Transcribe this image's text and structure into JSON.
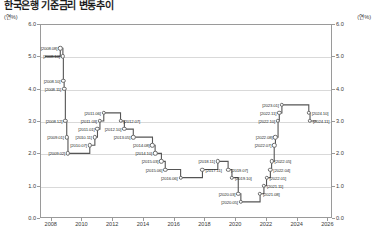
{
  "title": "한국은행 기준금리 변동추이",
  "axis": {
    "unit_left": "(연%)",
    "unit_right": "(연%)",
    "yticks": [
      "6.0",
      "5.0",
      "4.0",
      "3.0",
      "2.0",
      "1.0",
      "0.0"
    ],
    "xticks": [
      "2008",
      "2010",
      "2012",
      "2014",
      "2016",
      "2018",
      "2020",
      "2022",
      "2024",
      "2026"
    ]
  },
  "chart_data": {
    "type": "line",
    "title": "한국은행 기준금리 변동추이",
    "xlabel": "",
    "ylabel": "(연%)",
    "ylim": [
      0.0,
      6.0
    ],
    "xlim": [
      2007.3,
      2026.3
    ],
    "grid": true,
    "legend": "none",
    "step": "post",
    "series": [
      {
        "name": "한국은행 기준금리",
        "points": [
          {
            "date": "2007.08",
            "x": 2007.62,
            "y": 5.0,
            "label": "",
            "show": false
          },
          {
            "date": "2008.08",
            "x": 2008.62,
            "y": 5.25,
            "label": "[2008.08]",
            "side": "left"
          },
          {
            "date": "2008.10",
            "x": 2008.79,
            "y": 5.0,
            "label": "[2008.10]",
            "side": "left"
          },
          {
            "date": "2008.10",
            "x": 2008.82,
            "y": 4.25,
            "label": "[2008.10]",
            "side": "left"
          },
          {
            "date": "2008.11",
            "x": 2008.87,
            "y": 4.0,
            "label": "[2008.11]",
            "side": "left"
          },
          {
            "date": "2008.12",
            "x": 2008.95,
            "y": 3.0,
            "label": "[2008.12]",
            "side": "left"
          },
          {
            "date": "2009.01",
            "x": 2009.04,
            "y": 2.5,
            "label": "[2009.01]",
            "side": "left"
          },
          {
            "date": "2009.02",
            "x": 2009.12,
            "y": 2.0,
            "label": "[2009.02]",
            "side": "left"
          },
          {
            "date": "2010.07",
            "x": 2010.54,
            "y": 2.25,
            "label": "[2010.07]",
            "side": "left"
          },
          {
            "date": "2010.11",
            "x": 2010.87,
            "y": 2.5,
            "label": "[2010.11]",
            "side": "left"
          },
          {
            "date": "2011.01",
            "x": 2011.04,
            "y": 2.75,
            "label": "[2011.01]",
            "side": "left"
          },
          {
            "date": "2011.03",
            "x": 2011.2,
            "y": 3.0,
            "label": "[2011.03]",
            "side": "left"
          },
          {
            "date": "2011.06",
            "x": 2011.45,
            "y": 3.25,
            "label": "[2011.06]",
            "side": "left"
          },
          {
            "date": "2012.07",
            "x": 2012.54,
            "y": 3.0,
            "label": "[2012.07]",
            "side": "right"
          },
          {
            "date": "2012.10",
            "x": 2012.79,
            "y": 2.75,
            "label": "[2012.10]",
            "side": "left"
          },
          {
            "date": "2013.05",
            "x": 2013.37,
            "y": 2.5,
            "label": "[2013.05]",
            "side": "left"
          },
          {
            "date": "2014.08",
            "x": 2014.62,
            "y": 2.25,
            "label": "[2014.08]",
            "side": "left"
          },
          {
            "date": "2014.10",
            "x": 2014.79,
            "y": 2.0,
            "label": "[2014.10]",
            "side": "left"
          },
          {
            "date": "2015.03",
            "x": 2015.2,
            "y": 1.75,
            "label": "[2015.03]",
            "side": "left"
          },
          {
            "date": "2015.06",
            "x": 2015.45,
            "y": 1.5,
            "label": "[2015.06]",
            "side": "left"
          },
          {
            "date": "2016.06",
            "x": 2016.45,
            "y": 1.25,
            "label": "[2016.06]",
            "side": "left"
          },
          {
            "date": "2017.11",
            "x": 2017.87,
            "y": 1.5,
            "label": "[2017.11]",
            "side": "right"
          },
          {
            "date": "2018.11",
            "x": 2018.87,
            "y": 1.75,
            "label": "[2018.11]",
            "side": "left"
          },
          {
            "date": "2019.07",
            "x": 2019.54,
            "y": 1.5,
            "label": "[2019.07]",
            "side": "right"
          },
          {
            "date": "2019.10",
            "x": 2019.79,
            "y": 1.25,
            "label": "[2019.10]",
            "side": "right"
          },
          {
            "date": "2020.03",
            "x": 2020.2,
            "y": 0.75,
            "label": "[2020.03]",
            "side": "left"
          },
          {
            "date": "2020.05",
            "x": 2020.37,
            "y": 0.5,
            "label": "[2020.05]",
            "side": "left"
          },
          {
            "date": "2021.08",
            "x": 2021.62,
            "y": 0.75,
            "label": "[2021.08]",
            "side": "right"
          },
          {
            "date": "2021.11",
            "x": 2021.87,
            "y": 1.0,
            "label": "[2021.11]",
            "side": "right"
          },
          {
            "date": "2022.01",
            "x": 2022.04,
            "y": 1.25,
            "label": "[2022.01]",
            "side": "right"
          },
          {
            "date": "2022.04",
            "x": 2022.29,
            "y": 1.5,
            "label": "[2022.04]",
            "side": "right"
          },
          {
            "date": "2022.05",
            "x": 2022.37,
            "y": 1.75,
            "label": "[2022.05]",
            "side": "right"
          },
          {
            "date": "2022.07",
            "x": 2022.54,
            "y": 2.25,
            "label": "[2022.07]",
            "side": "left"
          },
          {
            "date": "2022.08",
            "x": 2022.62,
            "y": 2.5,
            "label": "[2022.08]",
            "side": "left"
          },
          {
            "date": "2022.10",
            "x": 2022.79,
            "y": 3.0,
            "label": "[2022.10]",
            "side": "left"
          },
          {
            "date": "2022.11",
            "x": 2022.87,
            "y": 3.25,
            "label": "[2022.11]",
            "side": "left"
          },
          {
            "date": "2023.01",
            "x": 2023.04,
            "y": 3.5,
            "label": "[2023.01]",
            "side": "left"
          },
          {
            "date": "2024.10",
            "x": 2024.79,
            "y": 3.25,
            "label": "[2024.10]",
            "side": "right"
          },
          {
            "date": "2024.11",
            "x": 2024.87,
            "y": 3.0,
            "label": "[2024.11]",
            "side": "right"
          },
          {
            "date": "end",
            "x": 2025.3,
            "y": 3.0,
            "label": "",
            "show": false
          }
        ]
      }
    ]
  },
  "style": {
    "line_color": "#555555",
    "grid_color": "#d9d9d9",
    "frame_color": "#9a9a9a",
    "text_color": "#2b2b2b"
  }
}
